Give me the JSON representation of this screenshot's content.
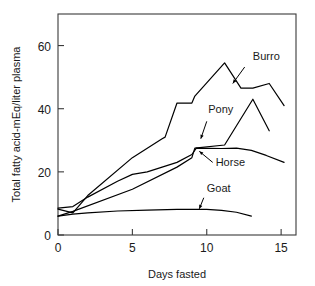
{
  "chart_data": {
    "type": "line",
    "title": "",
    "xlabel": "Days fasted",
    "ylabel": "Total fatty acid-mEq/liter plasma",
    "xlim": [
      0,
      16
    ],
    "ylim": [
      0,
      70
    ],
    "xticks": [
      0,
      5,
      10,
      15
    ],
    "xtick_labels": [
      "0",
      "5",
      "10",
      "15"
    ],
    "yticks": [
      0,
      20,
      40,
      60
    ],
    "ytick_labels": [
      "0",
      "20",
      "40",
      "60"
    ],
    "grid": false,
    "legend_position": "inline-annotations",
    "frame": "box",
    "series": [
      {
        "name": "Burro",
        "label": "Burro",
        "color": "#000000",
        "label_x": 13.1,
        "label_y": 55.5,
        "arrow_from_x": 12.55,
        "arrow_from_y": 53.2,
        "arrow_to_x": 11.75,
        "arrow_to_y": 48.0,
        "x": [
          0,
          1,
          2,
          5,
          7,
          7.2,
          8,
          9,
          9.2,
          11.2,
          12.3,
          13.1,
          14.2,
          15.2
        ],
        "y": [
          8.2,
          7.0,
          12.5,
          24.5,
          30.5,
          31.0,
          41.8,
          41.8,
          44.0,
          54.5,
          46.5,
          46.5,
          48.0,
          41.0
        ]
      },
      {
        "name": "Pony",
        "label": "Pony",
        "color": "#000000",
        "label_x": 10.1,
        "label_y": 38.5,
        "arrow_from_x": 10.0,
        "arrow_from_y": 36.0,
        "arrow_to_x": 9.6,
        "arrow_to_y": 30.5,
        "x": [
          0,
          1,
          5,
          8,
          9,
          9.2,
          11.2,
          13.1,
          14.2
        ],
        "y": [
          6.0,
          7.5,
          14.5,
          21.5,
          24.5,
          27.5,
          28.5,
          43.0,
          33.0
        ]
      },
      {
        "name": "Horse",
        "label": "Horse",
        "color": "#000000",
        "label_x": 10.6,
        "label_y": 22.0,
        "arrow_from_x": 10.4,
        "arrow_from_y": 23.0,
        "arrow_to_x": 9.5,
        "arrow_to_y": 26.5,
        "x": [
          0,
          1,
          2,
          4,
          5,
          6,
          7,
          8,
          9,
          9.3,
          11,
          12,
          13,
          14,
          15.2
        ],
        "y": [
          8.5,
          9.0,
          12.0,
          17.0,
          19.2,
          20.0,
          21.5,
          23.0,
          25.5,
          27.5,
          27.4,
          27.5,
          26.8,
          25.2,
          23.0
        ]
      },
      {
        "name": "Goat",
        "label": "Goat",
        "color": "#000000",
        "label_x": 10.0,
        "label_y": 13.5,
        "arrow_from_x": 9.8,
        "arrow_from_y": 11.8,
        "arrow_to_x": 9.5,
        "arrow_to_y": 8.3,
        "x": [
          0,
          1,
          2,
          4,
          6,
          8,
          10,
          11,
          12,
          13
        ],
        "y": [
          6.0,
          6.6,
          7.0,
          7.6,
          7.9,
          8.1,
          8.1,
          7.8,
          7.2,
          6.0
        ]
      }
    ]
  }
}
